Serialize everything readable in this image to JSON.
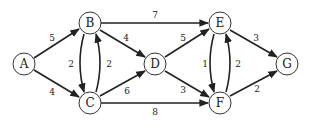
{
  "diagram": {
    "type": "directed-weighted-graph",
    "nodes": [
      {
        "id": "A",
        "label": "A",
        "x": 24,
        "y": 64
      },
      {
        "id": "B",
        "label": "B",
        "x": 90,
        "y": 23
      },
      {
        "id": "C",
        "label": "C",
        "x": 90,
        "y": 103
      },
      {
        "id": "D",
        "label": "D",
        "x": 155,
        "y": 64
      },
      {
        "id": "E",
        "label": "E",
        "x": 220,
        "y": 23
      },
      {
        "id": "F",
        "label": "F",
        "x": 220,
        "y": 103
      },
      {
        "id": "G",
        "label": "G",
        "x": 287,
        "y": 64
      }
    ],
    "edges": [
      {
        "from": "A",
        "to": "B",
        "weight": "5"
      },
      {
        "from": "A",
        "to": "C",
        "weight": "4"
      },
      {
        "from": "B",
        "to": "C",
        "weight": "2"
      },
      {
        "from": "C",
        "to": "B",
        "weight": "2"
      },
      {
        "from": "B",
        "to": "D",
        "weight": "4"
      },
      {
        "from": "C",
        "to": "D",
        "weight": "6"
      },
      {
        "from": "B",
        "to": "E",
        "weight": "7"
      },
      {
        "from": "C",
        "to": "F",
        "weight": "8"
      },
      {
        "from": "D",
        "to": "E",
        "weight": "5"
      },
      {
        "from": "D",
        "to": "F",
        "weight": "3"
      },
      {
        "from": "E",
        "to": "F",
        "weight": "1"
      },
      {
        "from": "F",
        "to": "E",
        "weight": "2"
      },
      {
        "from": "E",
        "to": "G",
        "weight": "3"
      },
      {
        "from": "F",
        "to": "G",
        "weight": "2"
      }
    ]
  }
}
